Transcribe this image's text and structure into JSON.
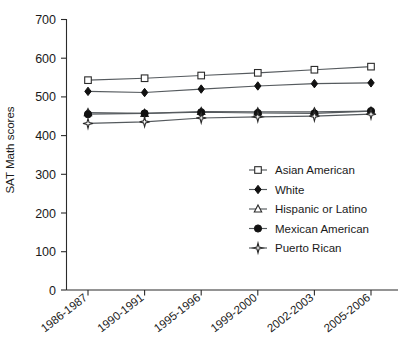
{
  "chart_data": {
    "type": "line",
    "title": "",
    "xlabel": "",
    "ylabel": "SAT Math scores",
    "ylim": [
      0,
      700
    ],
    "yticks": [
      0,
      100,
      200,
      300,
      400,
      500,
      600,
      700
    ],
    "grid": false,
    "legend_position": "center-right",
    "categories": [
      "1986-1987",
      "1990-1991",
      "1995-1996",
      "1999-2000",
      "2002-2003",
      "2005-2006"
    ],
    "series": [
      {
        "name": "Asian American",
        "marker": "open-square",
        "values": [
          543,
          548,
          555,
          562,
          570,
          578
        ]
      },
      {
        "name": "White",
        "marker": "filled-diamond",
        "values": [
          514,
          511,
          520,
          528,
          534,
          536
        ]
      },
      {
        "name": "Hispanic or Latino",
        "marker": "open-triangle",
        "values": [
          459,
          457,
          462,
          461,
          461,
          463
        ]
      },
      {
        "name": "Mexican American",
        "marker": "filled-circle",
        "values": [
          455,
          457,
          460,
          458,
          457,
          463
        ]
      },
      {
        "name": "Puerto Rican",
        "marker": "open-star",
        "values": [
          431,
          435,
          445,
          448,
          450,
          455
        ]
      }
    ],
    "colors": {
      "line": "#555a5e",
      "marker_stroke": "#2b2b2b",
      "marker_fill_open": "#ffffff",
      "marker_fill_solid": "#111111",
      "axis": "#2b2b2b",
      "text": "#1a1a1a",
      "background": "#ffffff"
    }
  },
  "axis": {
    "y_title": "SAT Math scores",
    "y_tick_labels": [
      "700",
      "600",
      "500",
      "400",
      "300",
      "200",
      "100",
      "0"
    ],
    "x_tick_labels": [
      "1986-1987",
      "1990-1991",
      "1995-1996",
      "1999-2000",
      "2002-2003",
      "2005-2006"
    ]
  },
  "legend": {
    "entries": [
      {
        "label": "Asian American",
        "marker": "open-square"
      },
      {
        "label": "White",
        "marker": "filled-diamond"
      },
      {
        "label": "Hispanic or Latino",
        "marker": "open-triangle"
      },
      {
        "label": "Mexican American",
        "marker": "filled-circle"
      },
      {
        "label": "Puerto Rican",
        "marker": "open-star"
      }
    ]
  }
}
